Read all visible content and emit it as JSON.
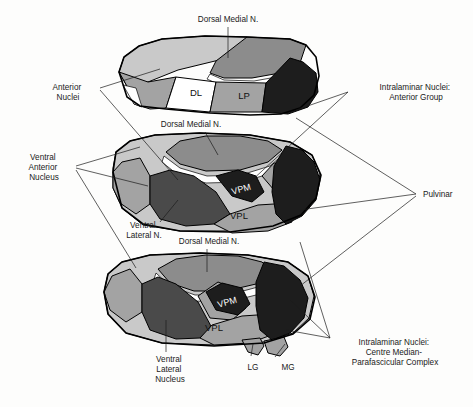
{
  "figure": {
    "background_color": "#fdfdfc",
    "line_color": "#1b1b1b"
  },
  "palette": {
    "white_region": "#ffffff",
    "light_gray": "#c9c9c9",
    "mid_gray": "#a3a3a3",
    "medium_gray": "#8c8c8c",
    "dark_gray": "#4a4a4a",
    "near_black": "#1d1d1d",
    "outline": "#000000"
  },
  "callouts": [
    {
      "id": "dorsal-medial-n-top",
      "text_lines": [
        "Dorsal Medial N."
      ],
      "x": 228,
      "y": 22,
      "anchor": "middle"
    },
    {
      "id": "anterior-nuclei",
      "text_lines": [
        "Anterior",
        "Nuclei"
      ],
      "x": 68,
      "y": 90,
      "anchor": "middle"
    },
    {
      "id": "intralaminar-anterior-group",
      "text_lines": [
        "Intralaminar Nuclei:",
        "Anterior Group"
      ],
      "x": 416,
      "y": 90,
      "anchor": "middle"
    },
    {
      "id": "dorsal-medial-n-middle",
      "text_lines": [
        "Dorsal Medial N."
      ],
      "x": 191,
      "y": 127,
      "anchor": "middle"
    },
    {
      "id": "ventral-anterior-nucleus",
      "text_lines": [
        "Ventral",
        "Anterior",
        "Nucleus"
      ],
      "x": 44,
      "y": 167,
      "anchor": "middle"
    },
    {
      "id": "pulvinar",
      "text_lines": [
        "Pulvinar"
      ],
      "x": 423,
      "y": 196,
      "anchor": "start"
    },
    {
      "id": "ventral-lateral-n",
      "text_lines": [
        "Ventral",
        "Lateral N."
      ],
      "x": 144,
      "y": 230,
      "anchor": "middle"
    },
    {
      "id": "dorsal-medial-n-bottom",
      "text_lines": [
        "Dorsal Medial N."
      ],
      "x": 209,
      "y": 244,
      "anchor": "middle"
    },
    {
      "id": "ventral-lateral-nucleus",
      "text_lines": [
        "Ventral",
        "Lateral",
        "Nucleus"
      ],
      "x": 170,
      "y": 363,
      "anchor": "middle"
    },
    {
      "id": "lg",
      "text_lines": [
        "LG"
      ],
      "x": 253,
      "y": 350,
      "anchor": "middle"
    },
    {
      "id": "mg",
      "text_lines": [
        "MG"
      ],
      "x": 288,
      "y": 350,
      "anchor": "middle"
    },
    {
      "id": "intralaminar-centre-median",
      "text_lines": [
        "Intralaminar Nuclei:",
        "Centre Median-",
        "Parafascicular Complex"
      ],
      "x": 395,
      "y": 345,
      "anchor": "middle"
    }
  ],
  "inline_labels": [
    {
      "id": "dl",
      "text": "DL",
      "x": 196,
      "y": 85,
      "color": "#111111"
    },
    {
      "id": "lp",
      "text": "LP",
      "x": 244,
      "y": 89,
      "color": "#111111"
    },
    {
      "id": "vpm-middle",
      "text": "VPM",
      "x": 240,
      "y": 188,
      "color": "#ffffff"
    },
    {
      "id": "vpl-middle",
      "text": "VPL",
      "x": 239,
      "y": 215,
      "color": "#111111"
    },
    {
      "id": "vpm-bottom",
      "text": "VPM",
      "x": 228,
      "y": 302,
      "color": "#ffffff"
    },
    {
      "id": "vpl-bottom",
      "text": "VPL",
      "x": 214,
      "y": 327,
      "color": "#111111"
    }
  ],
  "specimens": [
    {
      "id": "specimen-top",
      "name": "Superior view — intact thalamus",
      "regions": [
        {
          "name": "anterior-nuclei-region",
          "shade": "light_gray"
        },
        {
          "name": "dorsal-medial-nucleus-region",
          "shade": "medium_gray"
        },
        {
          "name": "dl-region",
          "shade": "white_region"
        },
        {
          "name": "lp-region",
          "shade": "mid_gray"
        },
        {
          "name": "pulvinar-region",
          "shade": "near_black"
        }
      ]
    },
    {
      "id": "specimen-middle",
      "name": "Middle view — partially dissected thalamus",
      "regions": [
        {
          "name": "ventral-anterior-nucleus-region",
          "shade": "light_gray"
        },
        {
          "name": "dorsal-medial-nucleus-region",
          "shade": "medium_gray"
        },
        {
          "name": "ventral-lateral-nucleus-region",
          "shade": "dark_gray"
        },
        {
          "name": "vpm-region",
          "shade": "near_black"
        },
        {
          "name": "vpl-region",
          "shade": "mid_gray"
        },
        {
          "name": "pulvinar-region",
          "shade": "near_black"
        }
      ]
    },
    {
      "id": "specimen-bottom",
      "name": "Inferior view — fully dissected thalamus",
      "regions": [
        {
          "name": "ventral-anterior-nucleus-region",
          "shade": "light_gray"
        },
        {
          "name": "dorsal-medial-nucleus-region",
          "shade": "medium_gray"
        },
        {
          "name": "ventral-lateral-nucleus-region",
          "shade": "dark_gray"
        },
        {
          "name": "vpm-region",
          "shade": "near_black"
        },
        {
          "name": "vpl-region",
          "shade": "mid_gray"
        },
        {
          "name": "centre-median-region",
          "shade": "near_black"
        },
        {
          "name": "lg-region",
          "shade": "mid_gray"
        },
        {
          "name": "mg-region",
          "shade": "mid_gray"
        }
      ]
    }
  ]
}
